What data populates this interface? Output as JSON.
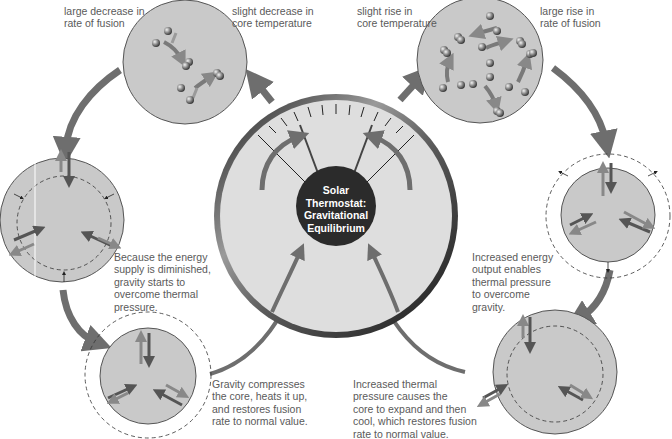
{
  "diagram": {
    "title": "Solar Thermostat: Gravitational Equilibrium",
    "center_label_lines": "Solar\nThermostat:\nGravitational\nEquilibrium",
    "colors": {
      "arrow": "#6e6e6e",
      "circle_fill": "#c9c9c9",
      "gauge_face": "#dedede",
      "gauge_rim": "#3a3a3a",
      "center_disc": "#2b2b2b",
      "text": "#5a5a5a"
    },
    "captions": {
      "top_left_a": "large decrease in\nrate of fusion",
      "top_left_b": "slight decrease in\ncore temperature",
      "top_right_a": "slight rise in\ncore temperature",
      "top_right_b": "large rise in\nrate of fusion",
      "left_mid": "Because the energy\nsupply is diminished,\ngravity starts to\novercome thermal\npressure.",
      "right_mid": "Increased energy\noutput enables\nthermal pressure\nto overcome\ngravity.",
      "bottom_left": "Gravity compresses\nthe core, heats it up,\nand restores fusion\nrate to normal value.",
      "bottom_right": "Increased thermal\npressure causes the\ncore to expand and then\ncool, which restores fusion\nrate to normal value."
    },
    "nodes": [
      {
        "id": "fusion-decrease",
        "label": "large decrease in rate of fusion / slight decrease in core temperature"
      },
      {
        "id": "core-contracting",
        "label": "Because the energy supply is diminished, gravity starts to overcome thermal pressure."
      },
      {
        "id": "core-compressed",
        "label": "Gravity compresses the core, heats it up, and restores fusion rate to normal value."
      },
      {
        "id": "fusion-increase",
        "label": "slight rise in core temperature / large rise in rate of fusion"
      },
      {
        "id": "core-expanding",
        "label": "Increased energy output enables thermal pressure to overcome gravity."
      },
      {
        "id": "core-expanded",
        "label": "Increased thermal pressure causes the core to expand and then cool, which restores fusion rate to normal value."
      },
      {
        "id": "thermostat",
        "label": "Solar Thermostat: Gravitational Equilibrium"
      }
    ],
    "edges": [
      {
        "from": "thermostat",
        "to": "fusion-decrease"
      },
      {
        "from": "fusion-decrease",
        "to": "core-contracting"
      },
      {
        "from": "core-contracting",
        "to": "core-compressed"
      },
      {
        "from": "core-compressed",
        "to": "thermostat"
      },
      {
        "from": "thermostat",
        "to": "fusion-increase"
      },
      {
        "from": "fusion-increase",
        "to": "core-expanding"
      },
      {
        "from": "core-expanding",
        "to": "core-expanded"
      },
      {
        "from": "core-expanded",
        "to": "thermostat"
      }
    ]
  }
}
